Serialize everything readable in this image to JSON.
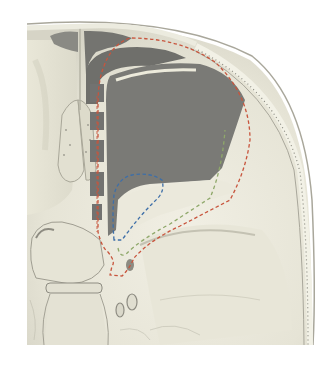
{
  "figure": {
    "type": "anatomical-illustration",
    "background": "#ffffff",
    "colors": {
      "bone_light": "#eceadb",
      "bone_shadow": "#cfcdbd",
      "bone_edge": "#9c9a8e",
      "diploe_dots": "#8a8a80",
      "sinus_dark": "#6e6e6a",
      "sinus_mid": "#7c7c78",
      "outline_red": "#c8553d",
      "outline_green": "#8fa86a",
      "outline_blue": "#3e6fa8"
    },
    "outlines": [
      {
        "name": "red-dashed-outline",
        "color": "#c8553d",
        "style": "dashed"
      },
      {
        "name": "green-dashed-outline",
        "color": "#8fa86a",
        "style": "dashed"
      },
      {
        "name": "blue-dashed-outline",
        "color": "#3e6fa8",
        "style": "dashed"
      }
    ],
    "text_labels": []
  }
}
